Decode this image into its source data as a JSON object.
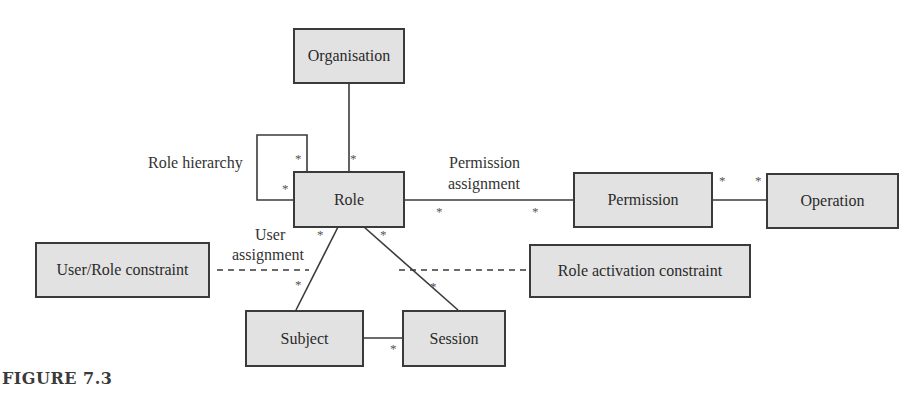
{
  "figure": {
    "caption": "FIGURE 7.3",
    "colors": {
      "box_fill": "#e2e2e2",
      "box_border": "#3a3a3a",
      "line": "#3a3a3a",
      "text": "#2a2a2a"
    }
  },
  "entities": {
    "organisation": "Organisation",
    "role": "Role",
    "permission": "Permission",
    "operation": "Operation",
    "user_role_constraint": "User/Role constraint",
    "role_activation_constraint": "Role activation constraint",
    "subject": "Subject",
    "session": "Session"
  },
  "relationships": {
    "role_hierarchy": "Role hierarchy",
    "permission_assignment_line1": "Permission",
    "permission_assignment_line2": "assignment",
    "user_assignment_line1": "User",
    "user_assignment_line2": "assignment"
  },
  "multiplicity": {
    "many": "*"
  }
}
